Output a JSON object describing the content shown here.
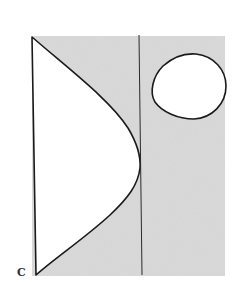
{
  "diagram": {
    "corner_label": "C",
    "colors": {
      "background": "#ffffff",
      "shaded_region": "#dadada",
      "stroke": "#1a1a1a"
    },
    "shapes": [
      {
        "name": "shaded-rectangle",
        "description": "gray stippled region bounded left by vertical edge"
      },
      {
        "name": "bulging-region",
        "description": "white region bounded by straight left edge and convex curve touching the vertical divider"
      },
      {
        "name": "vertical-divider",
        "description": "thin vertical line dividing shaded area"
      },
      {
        "name": "closed-loop",
        "description": "white rounded closed curve in upper right"
      }
    ]
  }
}
